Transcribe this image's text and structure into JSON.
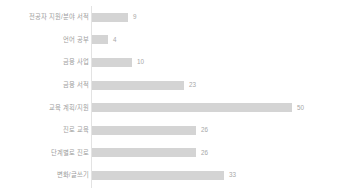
{
  "chart_data": {
    "type": "bar",
    "orientation": "horizontal",
    "title": "",
    "xlabel": "",
    "ylabel": "",
    "grid": false,
    "legend": false,
    "xlim": [
      0,
      50
    ],
    "categories": [
      "전공자 지원/분야 서적",
      "언어 공부",
      "금융 사업",
      "금융 서적",
      "교육 계획/지원",
      "진로 교육",
      "단계별로 진로",
      "변화/글쓰기"
    ],
    "values": [
      9,
      4,
      10,
      23,
      50,
      26,
      26,
      33
    ],
    "value_labels": [
      "9",
      "4",
      "10",
      "23",
      "50",
      "26",
      "26",
      "33"
    ],
    "bar_color": "#d4d4d4",
    "label_color": "#9d9d9d",
    "value_color": "#a8a8a8",
    "axis_color": "#e3e3e3"
  }
}
